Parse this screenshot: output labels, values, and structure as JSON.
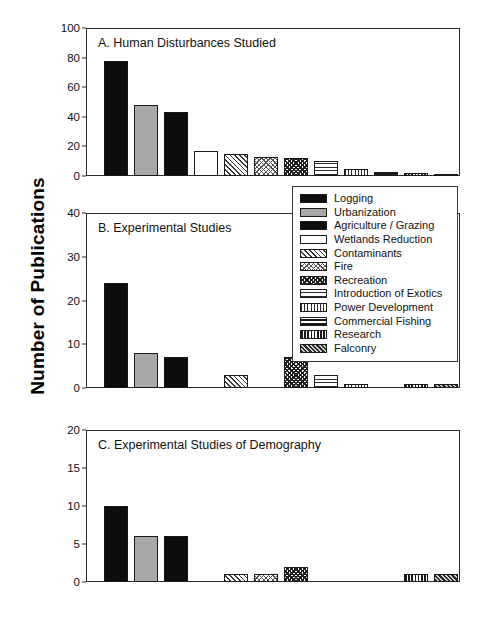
{
  "figure": {
    "ylabel": "Number of Publications"
  },
  "chart_data": {
    "type": "bar",
    "ylabel": "Number of Publications",
    "xlabel": "",
    "grid": false,
    "legend_position": "center-right, overlapping panels A and B",
    "categories": [
      "Logging",
      "Urbanization",
      "Agriculture / Grazing",
      "Wetlands Reduction",
      "Contaminants",
      "Fire",
      "Recreation",
      "Introduction of Exotics",
      "Power Development",
      "Commercial Fishing",
      "Research",
      "Falconry"
    ],
    "panels": [
      {
        "id": "A",
        "title": "A. Human Disturbances Studied",
        "ylim": [
          0,
          100
        ],
        "yticks": [
          0,
          20,
          40,
          60,
          80,
          100
        ],
        "values": [
          78,
          48,
          43,
          17,
          15,
          13,
          12,
          10,
          5,
          3,
          2,
          1
        ]
      },
      {
        "id": "B",
        "title": "B. Experimental Studies",
        "ylim": [
          0,
          40
        ],
        "yticks": [
          0,
          10,
          20,
          30,
          40
        ],
        "values": [
          24,
          8,
          7,
          0,
          3,
          0,
          7,
          3,
          1,
          0,
          1,
          1
        ]
      },
      {
        "id": "C",
        "title": "C. Experimental Studies of Demography",
        "ylim": [
          0,
          20
        ],
        "yticks": [
          0,
          5,
          10,
          15,
          20
        ],
        "values": [
          10,
          6,
          6,
          0,
          1,
          1,
          2,
          0,
          0,
          0,
          1,
          1
        ]
      }
    ]
  },
  "legend": {
    "items": [
      {
        "label": "Logging",
        "pattern": "solid-black"
      },
      {
        "label": "Urbanization",
        "pattern": "solid-gray"
      },
      {
        "label": "Agriculture / Grazing",
        "pattern": "solid-black"
      },
      {
        "label": "Wetlands Reduction",
        "pattern": "white"
      },
      {
        "label": "Contaminants",
        "pattern": "diagonal-hatch"
      },
      {
        "label": "Fire",
        "pattern": "cross-hatch"
      },
      {
        "label": "Recreation",
        "pattern": "checker"
      },
      {
        "label": "Introduction of Exotics",
        "pattern": "horizontal-lines-thin"
      },
      {
        "label": "Power Development",
        "pattern": "vertical-lines-thin"
      },
      {
        "label": "Commercial Fishing",
        "pattern": "horizontal-lines-thick"
      },
      {
        "label": "Research",
        "pattern": "vertical-lines-thick"
      },
      {
        "label": "Falconry",
        "pattern": "dense-diagonal"
      }
    ]
  },
  "colors": {
    "axis": "#2b2b2b",
    "text": "#111111",
    "background": "#ffffff"
  }
}
